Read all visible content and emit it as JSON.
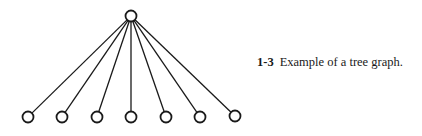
{
  "figure": {
    "number": "1-3",
    "caption": "Example of a tree graph."
  },
  "tree": {
    "root": {
      "x": 131,
      "y": 16,
      "r": 5.5
    },
    "leaves": [
      {
        "x": 28,
        "y": 117
      },
      {
        "x": 62,
        "y": 117
      },
      {
        "x": 97,
        "y": 117
      },
      {
        "x": 131,
        "y": 117
      },
      {
        "x": 166,
        "y": 117
      },
      {
        "x": 200,
        "y": 117
      },
      {
        "x": 235,
        "y": 116
      }
    ],
    "leaf_radius": 5.5,
    "stroke_color": "#1a1a1a"
  }
}
